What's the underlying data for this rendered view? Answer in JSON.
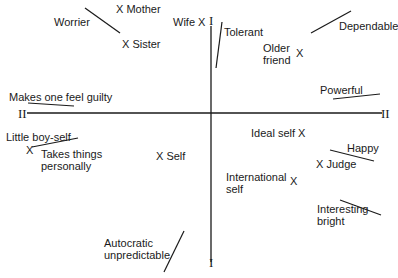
{
  "diagram": {
    "type": "principal-component-plot",
    "axes": {
      "vertical": {
        "label_top": "I",
        "label_bottom": "I"
      },
      "horizontal": {
        "label_left": "II",
        "label_right": "II"
      }
    },
    "elements": [
      {
        "id": "mother",
        "label": "Mother",
        "marker": "X"
      },
      {
        "id": "sister",
        "label": "Sister",
        "marker": "X"
      },
      {
        "id": "wife",
        "label": "Wife",
        "marker": "X"
      },
      {
        "id": "older-friend",
        "label": "Older\nfriend",
        "marker": "X"
      },
      {
        "id": "little-boy-self",
        "label": "Little boy-self",
        "marker": "X"
      },
      {
        "id": "self",
        "label": "Self",
        "marker": "X"
      },
      {
        "id": "ideal-self",
        "label": "Ideal self",
        "marker": "X"
      },
      {
        "id": "judge",
        "label": "Judge",
        "marker": "X"
      },
      {
        "id": "international-self",
        "label": "International\nself",
        "marker": "X"
      }
    ],
    "constructs": [
      {
        "id": "worrier",
        "label": "Worrier"
      },
      {
        "id": "tolerant",
        "label": "Tolerant"
      },
      {
        "id": "dependable",
        "label": "Dependable"
      },
      {
        "id": "makes-one-feel-guilty",
        "label": "Makes one feel guilty"
      },
      {
        "id": "powerful",
        "label": "Powerful"
      },
      {
        "id": "takes-things-personally",
        "label": "Takes things\npersonally"
      },
      {
        "id": "happy",
        "label": "Happy"
      },
      {
        "id": "interesting-bright",
        "label": "Interesting\nbright"
      },
      {
        "id": "autocratic-unpredictable",
        "label": "Autocratic\nunpredictable"
      }
    ]
  }
}
